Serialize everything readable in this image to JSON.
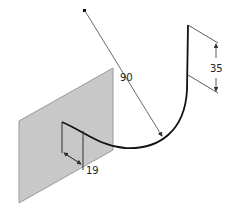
{
  "diagram": {
    "type": "cad-sketch-isometric",
    "colors": {
      "background": "#ffffff",
      "plane_fill": "#c8c8c8",
      "plane_edge": "#9a9a9a",
      "curve": "#111111",
      "dimension_line": "#333333"
    },
    "dimensions": {
      "radius": "90",
      "height": "35",
      "offset": "19"
    }
  }
}
